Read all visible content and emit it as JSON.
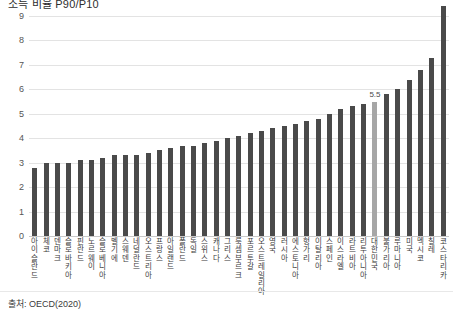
{
  "chart_data": {
    "type": "bar",
    "title": "소득 비율 P90/P10",
    "xlabel": "",
    "ylabel": "",
    "ylim": [
      0,
      9
    ],
    "yticks": [
      0,
      1,
      2,
      3,
      4,
      5,
      6,
      7,
      8,
      9
    ],
    "grid": true,
    "legend": null,
    "source": "출처: OECD(2020)",
    "highlight_category": "대한민국",
    "highlight_value": "5.5",
    "bar_color": "#4a4a4a",
    "highlight_color": "#a6a6a6",
    "categories": [
      "아이슬란드",
      "체코",
      "덴마크",
      "슬로바키아",
      "핀란드",
      "노르웨이",
      "슬로베니아",
      "벨기에",
      "스웨덴",
      "네덜란드",
      "오스트리아",
      "프랑스",
      "아일랜드",
      "폴란드",
      "독일",
      "스위스",
      "캐나다",
      "그리스",
      "룩셈부르크",
      "포르투갈",
      "오스트레일리아",
      "영국",
      "러시아",
      "에스토니아",
      "헝가리",
      "이탈리아",
      "스페인",
      "이스라엘",
      "라트비아",
      "리투아니아",
      "대한민국",
      "불가리아",
      "루마니아",
      "미국",
      "멕시코",
      "칠레",
      "코스타리카"
    ],
    "values": [
      2.8,
      3.0,
      3.0,
      3.0,
      3.1,
      3.1,
      3.2,
      3.3,
      3.3,
      3.3,
      3.4,
      3.5,
      3.6,
      3.7,
      3.7,
      3.8,
      3.9,
      4.0,
      4.1,
      4.2,
      4.3,
      4.4,
      4.5,
      4.6,
      4.7,
      4.8,
      5.0,
      5.2,
      5.3,
      5.4,
      5.5,
      5.8,
      6.0,
      6.4,
      6.8,
      7.3,
      9.4
    ],
    "value_labels": [
      "",
      "",
      "",
      "",
      "",
      "",
      "",
      "",
      "",
      "",
      "",
      "",
      "",
      "",
      "",
      "",
      "",
      "",
      "",
      "",
      "",
      "",
      "",
      "",
      "",
      "",
      "",
      "",
      "",
      "",
      "5.5",
      "",
      "",
      "",
      "",
      "",
      ""
    ]
  }
}
